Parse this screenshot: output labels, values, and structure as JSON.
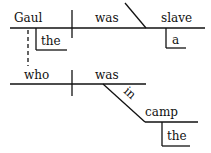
{
  "diagram": {
    "type": "sentence-diagram",
    "main_clause": {
      "subject": "Gaul",
      "subject_modifier": "the",
      "verb": "was",
      "complement": "slave",
      "complement_modifier": "a"
    },
    "relative_clause": {
      "subject": "who",
      "verb": "was",
      "preposition": "in",
      "object": "camp",
      "object_modifier": "the"
    }
  }
}
